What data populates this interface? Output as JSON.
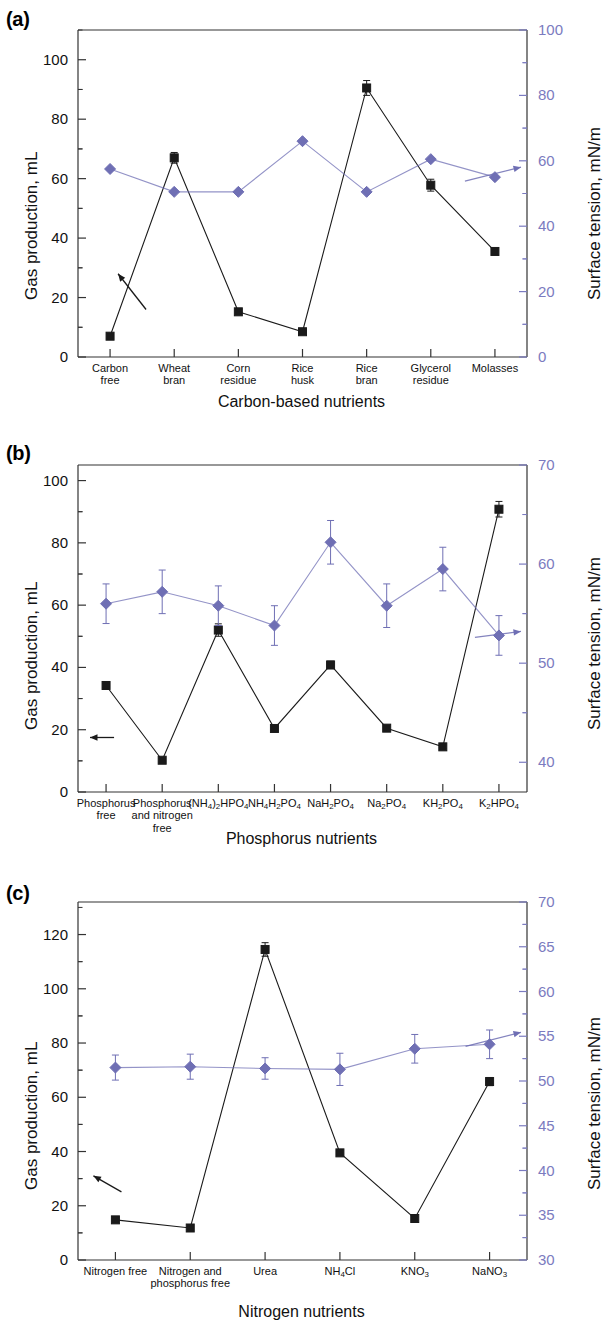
{
  "figure": {
    "panels": [
      {
        "tag": "(a)",
        "ylabel_left": "Gas production, mL",
        "ylabel_right": "Surface tension, mN/m",
        "xlabel": "Carbon-based nutrients"
      },
      {
        "tag": "(b)",
        "ylabel_left": "Gas production, mL",
        "ylabel_right": "Surface tension, mN/m",
        "xlabel": "Phosphorus nutrients"
      },
      {
        "tag": "(c)",
        "ylabel_left": "Gas production, mL",
        "ylabel_right": "Surface tension, mN/m",
        "xlabel": "Nitrogen nutrients"
      }
    ]
  },
  "colors": {
    "gas_series": "#1a1a1a",
    "tension_series": "#6f6fb4",
    "axis": "#333333",
    "right_axis_text": "#7b7bc0"
  },
  "chart_data": [
    {
      "type": "line",
      "panel": "(a)",
      "title": "",
      "xlabel": "Carbon-based nutrients",
      "ylabel": "Gas production, mL",
      "ylabel_right": "Surface tension, mN/m",
      "categories": [
        "Carbon free",
        "Wheat bran",
        "Corn residue",
        "Rice husk",
        "Rice bran",
        "Glycerol residue",
        "Molasses"
      ],
      "category_lines": [
        [
          "Carbon",
          "free"
        ],
        [
          "Wheat",
          "bran"
        ],
        [
          "Corn",
          "residue"
        ],
        [
          "Rice",
          "husk"
        ],
        [
          "Rice",
          "bran"
        ],
        [
          "Glycerol",
          "residue"
        ],
        [
          "Molasses"
        ]
      ],
      "ylim": [
        0,
        110
      ],
      "yticks": [
        0,
        20,
        40,
        60,
        80,
        100
      ],
      "ylim_right": [
        0,
        100
      ],
      "yticks_right": [
        0,
        20,
        40,
        60,
        80,
        100
      ],
      "grid": false,
      "legend": "none",
      "series": [
        {
          "name": "Gas production",
          "axis": "left",
          "marker": "square",
          "color": "#1a1a1a",
          "values": [
            7.0,
            67.0,
            15.2,
            8.5,
            90.5,
            57.8,
            35.5
          ],
          "errors": [
            0.8,
            1.8,
            0.8,
            0.8,
            2.5,
            2.0,
            1.0
          ]
        },
        {
          "name": "Surface tension",
          "axis": "right",
          "marker": "diamond",
          "color": "#6f6fb4",
          "values": [
            57.5,
            50.5,
            50.5,
            66.0,
            50.5,
            60.5,
            55.0
          ],
          "errors": [
            0.0,
            0.0,
            0.0,
            0.0,
            0.0,
            0.0,
            0.0
          ]
        }
      ],
      "annotations": [
        {
          "kind": "arrow",
          "points_to": "left-axis",
          "color": "#1a1a1a"
        },
        {
          "kind": "arrow",
          "points_to": "right-axis",
          "color": "#6f6fb4"
        }
      ]
    },
    {
      "type": "line",
      "panel": "(b)",
      "title": "",
      "xlabel": "Phosphorus nutrients",
      "ylabel": "Gas production, mL",
      "ylabel_right": "Surface tension, mN/m",
      "categories": [
        "Phosphorus free",
        "Phosphorus and nitrogen free",
        "(NH4)2HPO4",
        "NH4H2PO4",
        "NaH2PO4",
        "Na2PO4",
        "KH2PO4",
        "K2HPO4"
      ],
      "category_html": [
        "Phosphorus<br>free",
        "Phosphorus<br>and nitrogen<br>free",
        "(NH<sub>4</sub>)<sub>2</sub>HPO<sub>4</sub>",
        "NH<sub>4</sub>H<sub>2</sub>PO<sub>4</sub>",
        "NaH<sub>2</sub>PO<sub>4</sub>",
        "Na<sub>2</sub>PO<sub>4</sub>",
        "KH<sub>2</sub>PO<sub>4</sub>",
        "K<sub>2</sub>HPO<sub>4</sub>"
      ],
      "ylim": [
        0,
        105
      ],
      "yticks": [
        0,
        20,
        40,
        60,
        80,
        100
      ],
      "ylim_right": [
        37,
        70
      ],
      "yticks_right": [
        40,
        50,
        60,
        70
      ],
      "grid": false,
      "legend": "none",
      "series": [
        {
          "name": "Gas production",
          "axis": "left",
          "marker": "square",
          "color": "#1a1a1a",
          "values": [
            34.2,
            10.2,
            52.0,
            20.4,
            40.8,
            20.5,
            14.5,
            90.8
          ],
          "errors": [
            0.6,
            0.6,
            2.0,
            0.6,
            1.2,
            0.6,
            0.6,
            2.5
          ]
        },
        {
          "name": "Surface tension",
          "axis": "right",
          "marker": "diamond",
          "color": "#6f6fb4",
          "values": [
            56.0,
            57.2,
            55.8,
            53.8,
            62.2,
            55.8,
            59.5,
            52.8
          ],
          "errors": [
            2.0,
            2.2,
            2.0,
            2.0,
            2.2,
            2.2,
            2.2,
            2.0
          ]
        }
      ],
      "annotations": [
        {
          "kind": "arrow",
          "points_to": "left-axis",
          "color": "#1a1a1a"
        },
        {
          "kind": "arrow",
          "points_to": "right-axis",
          "color": "#6f6fb4"
        }
      ]
    },
    {
      "type": "line",
      "panel": "(c)",
      "title": "",
      "xlabel": "Nitrogen nutrients",
      "ylabel": "Gas production, mL",
      "ylabel_right": "Surface tension, mN/m",
      "categories": [
        "Nitrogen free",
        "Nitrogen and phosphorus free",
        "Urea",
        "NH4Cl",
        "KNO3",
        "NaNO3"
      ],
      "category_html": [
        "Nitrogen free",
        "Nitrogen and<br>phosphorus free",
        "Urea",
        "NH<sub>4</sub>Cl",
        "KNO<sub>3</sub>",
        "NaNO<sub>3</sub>"
      ],
      "ylim": [
        0,
        132
      ],
      "yticks": [
        0,
        20,
        40,
        60,
        80,
        100,
        120
      ],
      "ylim_right": [
        30,
        70
      ],
      "yticks_right": [
        30,
        35,
        40,
        45,
        50,
        55,
        60,
        65,
        70
      ],
      "grid": false,
      "legend": "none",
      "series": [
        {
          "name": "Gas production",
          "axis": "left",
          "marker": "square",
          "color": "#1a1a1a",
          "values": [
            14.8,
            11.8,
            114.5,
            39.5,
            15.3,
            65.8
          ],
          "errors": [
            0.6,
            0.6,
            2.5,
            0.8,
            0.6,
            1.5
          ]
        },
        {
          "name": "Surface tension",
          "axis": "right",
          "marker": "diamond",
          "color": "#6f6fb4",
          "values": [
            51.5,
            51.6,
            51.4,
            51.3,
            53.6,
            54.1
          ],
          "errors": [
            1.4,
            1.4,
            1.2,
            1.8,
            1.6,
            1.6
          ]
        }
      ],
      "annotations": [
        {
          "kind": "arrow",
          "points_to": "left-axis",
          "color": "#1a1a1a"
        },
        {
          "kind": "arrow",
          "points_to": "right-axis",
          "color": "#6f6fb4"
        }
      ]
    }
  ]
}
